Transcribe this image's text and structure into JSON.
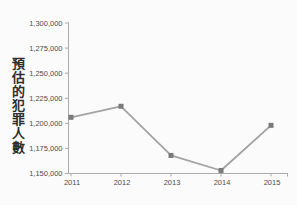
{
  "chart_data": {
    "type": "line",
    "title": "",
    "xlabel": "",
    "ylabel": "預估的犯罪人數",
    "categories": [
      "2011",
      "2012",
      "2013",
      "2014",
      "2015"
    ],
    "values": [
      1206000,
      1217000,
      1168000,
      1153000,
      1198000
    ],
    "ylim": [
      1150000,
      1300000
    ],
    "ytick_step": 25000,
    "ytick_labels": [
      "1,300,000",
      "1,275,000",
      "1,250,000",
      "1,225,000",
      "1,200,000",
      "1,175,000",
      "1,150,000"
    ],
    "grid": false,
    "legend_position": "none",
    "marker": "square",
    "colors": {
      "line": "#a3a3a3",
      "marker": "#7a7a7a",
      "axis": "#ababab",
      "tick_text": "#4d4d4d",
      "background": "#fbfbfb"
    }
  }
}
